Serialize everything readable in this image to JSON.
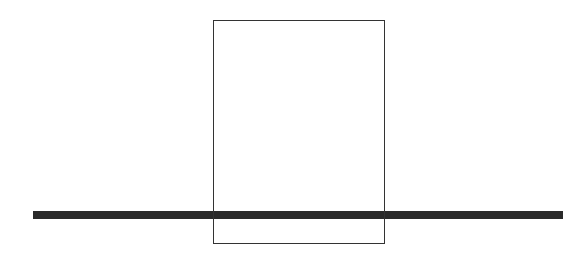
{
  "diagram": {
    "rectangle": {
      "x": 213,
      "y": 20,
      "width": 172,
      "height": 224,
      "stroke": "#333333"
    },
    "bar": {
      "x": 33,
      "y": 211,
      "width": 530,
      "height": 8,
      "fill": "#2a2a2a"
    }
  }
}
